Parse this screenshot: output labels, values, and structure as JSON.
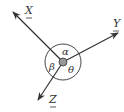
{
  "diagram": {
    "type": "vector-angles",
    "center": {
      "x": 63,
      "y": 62
    },
    "vectors": [
      {
        "name": "X",
        "label": "X",
        "tip": {
          "x": 13,
          "y": 12
        },
        "label_pos": {
          "x": 25,
          "y": 14
        }
      },
      {
        "name": "Y",
        "label": "Y",
        "tip": {
          "x": 118,
          "y": 33
        },
        "label_pos": {
          "x": 113,
          "y": 27
        }
      },
      {
        "name": "Z",
        "label": "Z",
        "tip": {
          "x": 38,
          "y": 100
        },
        "label_pos": {
          "x": 49,
          "y": 103
        }
      }
    ],
    "angles": [
      {
        "name": "alpha",
        "symbol": "α",
        "between": [
          "X",
          "Y"
        ]
      },
      {
        "name": "beta",
        "symbol": "β",
        "between": [
          "X",
          "Z"
        ]
      },
      {
        "name": "theta",
        "symbol": "θ",
        "between": [
          "Y",
          "Z"
        ]
      }
    ],
    "circle_radius": 18,
    "colors": {
      "line": "#333333",
      "dot_fill": "#999999",
      "background": "#ffffff"
    }
  }
}
